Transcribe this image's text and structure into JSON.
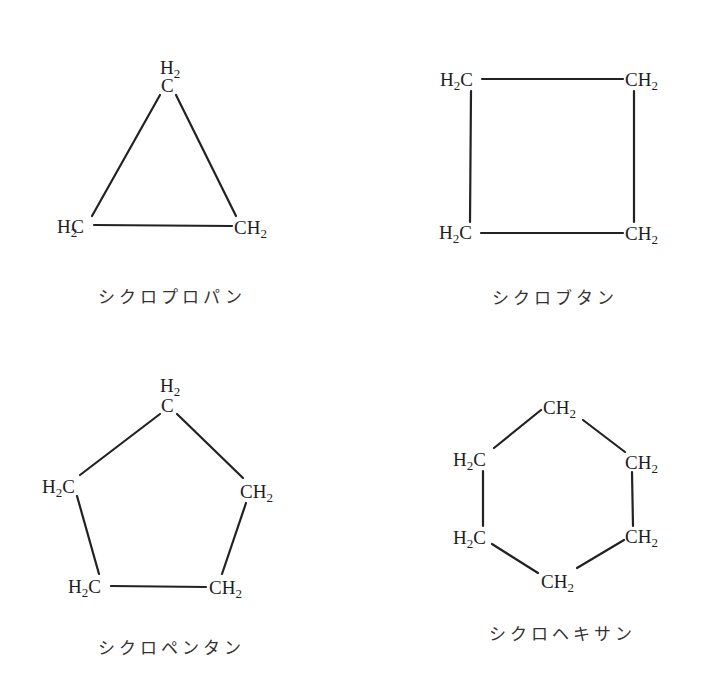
{
  "diagram": {
    "type": "structural-formulas",
    "molecules": [
      {
        "id": "cyclopropane",
        "name": "シクロプロパン",
        "atoms": [
          {
            "main": "C",
            "h_label": "H",
            "h_sub": "2",
            "pos": "top"
          },
          {
            "main": "H",
            "sub": "2",
            "tail": "C",
            "pos": "bottom-left"
          },
          {
            "main": "CH",
            "sub": "2",
            "pos": "bottom-right"
          }
        ]
      },
      {
        "id": "cyclobutane",
        "name": "シクロブタン",
        "atoms": [
          {
            "main": "H",
            "sub": "2",
            "tail": "C",
            "pos": "top-left"
          },
          {
            "main": "CH",
            "sub": "2",
            "pos": "top-right"
          },
          {
            "main": "H",
            "sub": "2",
            "tail": "C",
            "pos": "bottom-left"
          },
          {
            "main": "CH",
            "sub": "2",
            "pos": "bottom-right"
          }
        ]
      },
      {
        "id": "cyclopentane",
        "name": "シクロペンタン",
        "atoms": [
          {
            "main": "C",
            "h_label": "H",
            "h_sub": "2",
            "pos": "top"
          },
          {
            "main": "H",
            "sub": "2",
            "tail": "C",
            "pos": "left"
          },
          {
            "main": "CH",
            "sub": "2",
            "pos": "right"
          },
          {
            "main": "H",
            "sub": "2",
            "tail": "C",
            "pos": "bottom-left"
          },
          {
            "main": "CH",
            "sub": "2",
            "pos": "bottom-right"
          }
        ]
      },
      {
        "id": "cyclohexane",
        "name": "シクロヘキサン",
        "atoms": [
          {
            "main": "CH",
            "sub": "2",
            "pos": "top"
          },
          {
            "main": "H",
            "sub": "2",
            "tail": "C",
            "pos": "upper-left"
          },
          {
            "main": "CH",
            "sub": "2",
            "pos": "upper-right"
          },
          {
            "main": "H",
            "sub": "2",
            "tail": "C",
            "pos": "lower-left"
          },
          {
            "main": "CH",
            "sub": "2",
            "pos": "lower-right"
          },
          {
            "main": "CH",
            "sub": "2",
            "pos": "bottom"
          }
        ]
      }
    ],
    "colors": {
      "ink": "#222222",
      "background": "#ffffff"
    }
  }
}
